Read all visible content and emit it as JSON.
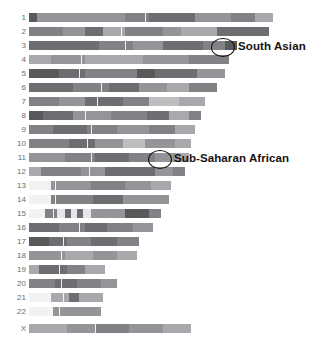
{
  "figure": {
    "type": "chromosome-painting-karyogram",
    "background_color": "#ffffff",
    "label_color": "#6b6b6b",
    "annotation_color": "#17120f"
  },
  "chart_data": {
    "type": "heatmap",
    "title": "",
    "xlabel": "",
    "ylabel": "",
    "grid": false,
    "legend_position": "none",
    "categories": [
      "1",
      "2",
      "3",
      "4",
      "5",
      "6",
      "7",
      "8",
      "9",
      "10",
      "11",
      "12",
      "13",
      "14",
      "15",
      "16",
      "17",
      "18",
      "19",
      "20",
      "21",
      "22",
      "X"
    ],
    "palette": {
      "very-dark": "#58595b",
      "dark": "#6d6e71",
      "mid-dark": "#808285",
      "mid": "#939598",
      "mid-light": "#a7a9ac",
      "light": "#bcbec0",
      "very-light": "#d1d3d4",
      "pale": "#e6e7e8",
      "near-white": "#f1f2f2"
    },
    "rows": [
      {
        "name": "1",
        "y": 13,
        "x": 29,
        "width": 244,
        "centromere": 116,
        "segments": [
          {
            "w": 8,
            "c": "#58595b"
          },
          {
            "w": 88,
            "c": "#939598"
          },
          {
            "w": 24,
            "c": "#808285"
          },
          {
            "w": 46,
            "c": "#6d6e71"
          },
          {
            "w": 36,
            "c": "#939598"
          },
          {
            "w": 24,
            "c": "#808285"
          },
          {
            "w": 18,
            "c": "#a7a9ac"
          }
        ]
      },
      {
        "name": "2",
        "y": 27,
        "x": 29,
        "width": 240,
        "centromere": 92,
        "segments": [
          {
            "w": 34,
            "c": "#808285"
          },
          {
            "w": 22,
            "c": "#939598"
          },
          {
            "w": 18,
            "c": "#6d6e71"
          },
          {
            "w": 22,
            "c": "#a7a9ac"
          },
          {
            "w": 38,
            "c": "#808285"
          },
          {
            "w": 18,
            "c": "#939598"
          },
          {
            "w": 36,
            "c": "#a7a9ac"
          },
          {
            "w": 52,
            "c": "#6d6e71"
          }
        ]
      },
      {
        "name": "3",
        "y": 41,
        "x": 29,
        "width": 208,
        "centromere": 96,
        "segments": [
          {
            "w": 70,
            "c": "#6d6e71"
          },
          {
            "w": 34,
            "c": "#808285"
          },
          {
            "w": 30,
            "c": "#939598"
          },
          {
            "w": 40,
            "c": "#6d6e71"
          },
          {
            "w": 22,
            "c": "#808285"
          },
          {
            "w": 12,
            "c": "#58595b"
          }
        ]
      },
      {
        "name": "4",
        "y": 55,
        "x": 29,
        "width": 200,
        "centromere": 52,
        "segments": [
          {
            "w": 22,
            "c": "#a7a9ac"
          },
          {
            "w": 34,
            "c": "#939598"
          },
          {
            "w": 58,
            "c": "#a7a9ac"
          },
          {
            "w": 46,
            "c": "#939598"
          },
          {
            "w": 40,
            "c": "#808285"
          }
        ]
      },
      {
        "name": "5",
        "y": 69,
        "x": 29,
        "width": 196,
        "centromere": 50,
        "segments": [
          {
            "w": 30,
            "c": "#58595b"
          },
          {
            "w": 26,
            "c": "#6d6e71"
          },
          {
            "w": 52,
            "c": "#808285"
          },
          {
            "w": 18,
            "c": "#58595b"
          },
          {
            "w": 42,
            "c": "#6d6e71"
          },
          {
            "w": 28,
            "c": "#939598"
          }
        ]
      },
      {
        "name": "6",
        "y": 83,
        "x": 29,
        "width": 188,
        "centromere": 72,
        "segments": [
          {
            "w": 44,
            "c": "#6d6e71"
          },
          {
            "w": 36,
            "c": "#808285"
          },
          {
            "w": 30,
            "c": "#6d6e71"
          },
          {
            "w": 28,
            "c": "#939598"
          },
          {
            "w": 22,
            "c": "#a7a9ac"
          },
          {
            "w": 28,
            "c": "#808285"
          }
        ]
      },
      {
        "name": "7",
        "y": 97,
        "x": 29,
        "width": 176,
        "centromere": 68,
        "segments": [
          {
            "w": 30,
            "c": "#808285"
          },
          {
            "w": 26,
            "c": "#939598"
          },
          {
            "w": 38,
            "c": "#6d6e71"
          },
          {
            "w": 26,
            "c": "#808285"
          },
          {
            "w": 30,
            "c": "#bcbec0"
          },
          {
            "w": 26,
            "c": "#a7a9ac"
          }
        ]
      },
      {
        "name": "8",
        "y": 111,
        "x": 29,
        "width": 172,
        "centromere": 56,
        "segments": [
          {
            "w": 14,
            "c": "#58595b"
          },
          {
            "w": 30,
            "c": "#6d6e71"
          },
          {
            "w": 38,
            "c": "#939598"
          },
          {
            "w": 36,
            "c": "#808285"
          },
          {
            "w": 22,
            "c": "#6d6e71"
          },
          {
            "w": 20,
            "c": "#a7a9ac"
          },
          {
            "w": 12,
            "c": "#808285"
          }
        ]
      },
      {
        "name": "9",
        "y": 125,
        "x": 29,
        "width": 166,
        "centromere": 62,
        "segments": [
          {
            "w": 24,
            "c": "#808285"
          },
          {
            "w": 34,
            "c": "#6d6e71"
          },
          {
            "w": 30,
            "c": "#808285"
          },
          {
            "w": 32,
            "c": "#939598"
          },
          {
            "w": 26,
            "c": "#808285"
          },
          {
            "w": 20,
            "c": "#a7a9ac"
          }
        ]
      },
      {
        "name": "10",
        "y": 139,
        "x": 29,
        "width": 162,
        "centromere": 58,
        "segments": [
          {
            "w": 40,
            "c": "#808285"
          },
          {
            "w": 26,
            "c": "#6d6e71"
          },
          {
            "w": 28,
            "c": "#939598"
          },
          {
            "w": 22,
            "c": "#bcbec0"
          },
          {
            "w": 30,
            "c": "#939598"
          },
          {
            "w": 16,
            "c": "#a7a9ac"
          }
        ]
      },
      {
        "name": "11",
        "y": 153,
        "x": 29,
        "width": 160,
        "centromere": 62,
        "segments": [
          {
            "w": 36,
            "c": "#939598"
          },
          {
            "w": 30,
            "c": "#808285"
          },
          {
            "w": 34,
            "c": "#6d6e71"
          },
          {
            "w": 26,
            "c": "#808285"
          },
          {
            "w": 20,
            "c": "#939598"
          },
          {
            "w": 14,
            "c": "#a7a9ac"
          }
        ]
      },
      {
        "name": "12",
        "y": 167,
        "x": 29,
        "width": 156,
        "centromere": 60,
        "segments": [
          {
            "w": 12,
            "c": "#a7a9ac"
          },
          {
            "w": 40,
            "c": "#808285"
          },
          {
            "w": 24,
            "c": "#939598"
          },
          {
            "w": 50,
            "c": "#6d6e71"
          },
          {
            "w": 18,
            "c": "#939598"
          },
          {
            "w": 12,
            "c": "#808285"
          }
        ]
      },
      {
        "name": "13",
        "y": 181,
        "x": 29,
        "width": 142,
        "centromere": 26,
        "lead_blank": 22,
        "segments": [
          {
            "w": 22,
            "c": "#f1f2f2"
          },
          {
            "w": 40,
            "c": "#939598"
          },
          {
            "w": 34,
            "c": "#808285"
          },
          {
            "w": 26,
            "c": "#939598"
          },
          {
            "w": 20,
            "c": "#a7a9ac"
          }
        ]
      },
      {
        "name": "14",
        "y": 195,
        "x": 29,
        "width": 140,
        "centromere": 26,
        "lead_blank": 22,
        "segments": [
          {
            "w": 22,
            "c": "#f1f2f2"
          },
          {
            "w": 42,
            "c": "#808285"
          },
          {
            "w": 30,
            "c": "#6d6e71"
          },
          {
            "w": 46,
            "c": "#939598"
          }
        ]
      },
      {
        "name": "15",
        "y": 209,
        "x": 29,
        "width": 132,
        "centromere": 24,
        "lead_blank": 16,
        "segments": [
          {
            "w": 16,
            "c": "#f1f2f2"
          },
          {
            "w": 12,
            "c": "#808285"
          },
          {
            "w": 8,
            "c": "#e6e7e8"
          },
          {
            "w": 6,
            "c": "#6d6e71"
          },
          {
            "w": 6,
            "c": "#e6e7e8"
          },
          {
            "w": 6,
            "c": "#6d6e71"
          },
          {
            "w": 8,
            "c": "#e6e7e8"
          },
          {
            "w": 34,
            "c": "#939598"
          },
          {
            "w": 24,
            "c": "#58595b"
          },
          {
            "w": 12,
            "c": "#808285"
          }
        ]
      },
      {
        "name": "16",
        "y": 223,
        "x": 29,
        "width": 124,
        "centromere": 50,
        "segments": [
          {
            "w": 30,
            "c": "#6d6e71"
          },
          {
            "w": 26,
            "c": "#808285"
          },
          {
            "w": 22,
            "c": "#6d6e71"
          },
          {
            "w": 26,
            "c": "#808285"
          },
          {
            "w": 20,
            "c": "#939598"
          }
        ]
      },
      {
        "name": "17",
        "y": 237,
        "x": 29,
        "width": 110,
        "centromere": 34,
        "segments": [
          {
            "w": 20,
            "c": "#58595b"
          },
          {
            "w": 18,
            "c": "#6d6e71"
          },
          {
            "w": 24,
            "c": "#808285"
          },
          {
            "w": 26,
            "c": "#6d6e71"
          },
          {
            "w": 22,
            "c": "#808285"
          }
        ]
      },
      {
        "name": "18",
        "y": 251,
        "x": 29,
        "width": 108,
        "centromere": 32,
        "segments": [
          {
            "w": 36,
            "c": "#939598"
          },
          {
            "w": 28,
            "c": "#a7a9ac"
          },
          {
            "w": 24,
            "c": "#939598"
          },
          {
            "w": 20,
            "c": "#a7a9ac"
          }
        ]
      },
      {
        "name": "19",
        "y": 265,
        "x": 29,
        "width": 76,
        "centromere": 30,
        "segments": [
          {
            "w": 10,
            "c": "#a7a9ac"
          },
          {
            "w": 28,
            "c": "#6d6e71"
          },
          {
            "w": 18,
            "c": "#808285"
          },
          {
            "w": 20,
            "c": "#a7a9ac"
          }
        ]
      },
      {
        "name": "20",
        "y": 279,
        "x": 29,
        "width": 88,
        "centromere": 32,
        "segments": [
          {
            "w": 26,
            "c": "#808285"
          },
          {
            "w": 22,
            "c": "#6d6e71"
          },
          {
            "w": 24,
            "c": "#808285"
          },
          {
            "w": 16,
            "c": "#939598"
          }
        ]
      },
      {
        "name": "21",
        "y": 293,
        "x": 29,
        "width": 74,
        "centromere": 34,
        "lead_blank": 22,
        "segments": [
          {
            "w": 22,
            "c": "#f1f2f2"
          },
          {
            "w": 18,
            "c": "#a7a9ac"
          },
          {
            "w": 10,
            "c": "#6d6e71"
          },
          {
            "w": 24,
            "c": "#a7a9ac"
          }
        ]
      },
      {
        "name": "22",
        "y": 307,
        "x": 29,
        "width": 72,
        "centromere": 30,
        "lead_blank": 24,
        "segments": [
          {
            "w": 24,
            "c": "#f1f2f2"
          },
          {
            "w": 48,
            "c": "#939598"
          }
        ]
      },
      {
        "name": "X",
        "y": 324,
        "x": 29,
        "width": 162,
        "centromere": 66,
        "segments": [
          {
            "w": 38,
            "c": "#a7a9ac"
          },
          {
            "w": 28,
            "c": "#939598"
          },
          {
            "w": 34,
            "c": "#808285"
          },
          {
            "w": 34,
            "c": "#939598"
          },
          {
            "w": 28,
            "c": "#a7a9ac"
          }
        ]
      }
    ],
    "annotations": [
      {
        "label": "South Asian",
        "chromosome": "3",
        "circle": {
          "x": 211,
          "y": 38,
          "w": 22,
          "h": 17
        },
        "text": {
          "x": 238,
          "y": 40
        }
      },
      {
        "label": "Sub-Saharan African",
        "chromosome": "11",
        "circle": {
          "x": 148,
          "y": 150,
          "w": 22,
          "h": 17
        },
        "text": {
          "x": 174,
          "y": 152
        }
      }
    ]
  }
}
